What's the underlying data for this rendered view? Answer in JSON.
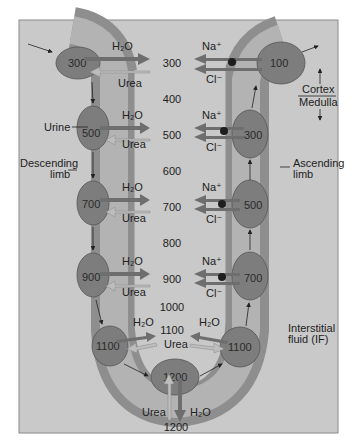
{
  "diagram": {
    "type": "countercurrent-multiplier-loop-of-henle",
    "colors": {
      "panel_bg": "#c9c9c9",
      "panel_border": "#8a8a8a",
      "tube_outer": "#8e8e8e",
      "tube_lumen": "#b3b3b3",
      "cell": "#7d7d7d",
      "arrow_dark": "#6e6e6e",
      "arrow_light": "#bdbdbd",
      "pump": "#1e1e1e"
    },
    "interstitial_scale": [
      "300",
      "400",
      "500",
      "600",
      "700",
      "800",
      "900",
      "1000",
      "1100"
    ],
    "bottom_value": "1200",
    "descending_cells": [
      {
        "value": "300",
        "out": "H₂O",
        "in": "Urea"
      },
      {
        "value": "500",
        "out": "H₂O",
        "in": "Urea"
      },
      {
        "value": "700",
        "out": "H₂O",
        "in": "Urea"
      },
      {
        "value": "900",
        "out": "H₂O",
        "in": "Urea"
      },
      {
        "value": "1100",
        "out": "H₂O",
        "in": "Urea"
      }
    ],
    "ascending_cells": [
      {
        "value": "100",
        "ion1": "Na⁺",
        "ion2": "Cl⁻"
      },
      {
        "value": "300",
        "ion1": "Na⁺",
        "ion2": "Cl⁻"
      },
      {
        "value": "500",
        "ion1": "Na⁺",
        "ion2": "Cl⁻"
      },
      {
        "value": "700",
        "ion1": "Na⁺",
        "ion2": "Cl⁻"
      },
      {
        "value": "1100",
        "ion1": "H₂O",
        "ion2": "Urea"
      }
    ],
    "bottom_cell": {
      "value": "1200",
      "in": "Urea",
      "out": "H₂O"
    },
    "labels": {
      "urine": "Urine",
      "descending_line1": "Descending",
      "descending_line2": "limb",
      "ascending_line1": "Ascending",
      "ascending_line2": "limb",
      "cortex": "Cortex",
      "medulla": "Medulla",
      "if_line1": "Interstitial",
      "if_line2": "fluid (IF)"
    }
  }
}
